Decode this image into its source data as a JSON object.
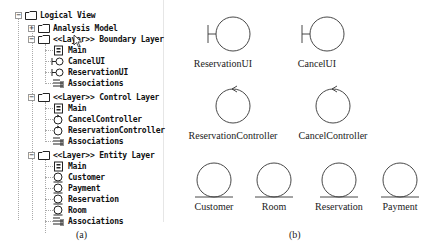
{
  "tree": {
    "root": {
      "label": "Logical View",
      "expander": "−"
    },
    "analysis": {
      "label": "Analysis Model",
      "expander": "+"
    },
    "boundary": {
      "label": "<<Layer>> Boundary Layer",
      "expander": "−",
      "items": [
        {
          "label": "Main",
          "icon": "class-diagram-icon"
        },
        {
          "label": "CancelUI",
          "icon": "boundary-icon"
        },
        {
          "label": "ReservationUI",
          "icon": "boundary-icon"
        },
        {
          "label": "Associations",
          "icon": "associations-icon"
        }
      ]
    },
    "control": {
      "label": "<<Layer>> Control Layer",
      "expander": "−",
      "items": [
        {
          "label": "Main",
          "icon": "class-diagram-icon"
        },
        {
          "label": "CancelController",
          "icon": "control-icon"
        },
        {
          "label": "ReservationController",
          "icon": "control-icon"
        },
        {
          "label": "Associations",
          "icon": "associations-icon"
        }
      ]
    },
    "entity": {
      "label": "<<Layer>> Entity Layer",
      "expander": "−",
      "items": [
        {
          "label": "Main",
          "icon": "class-diagram-icon"
        },
        {
          "label": "Customer",
          "icon": "entity-icon"
        },
        {
          "label": "Payment",
          "icon": "entity-icon"
        },
        {
          "label": "Reservation",
          "icon": "entity-icon"
        },
        {
          "label": "Room",
          "icon": "entity-icon"
        },
        {
          "label": "Associations",
          "icon": "associations-icon"
        }
      ]
    }
  },
  "diagram": {
    "boundary": [
      "ReservationUI",
      "CancelUI"
    ],
    "control": [
      "ReservationController",
      "CancelController"
    ],
    "entity": [
      "Customer",
      "Room",
      "Reservation",
      "Payment"
    ]
  },
  "captions": {
    "a": "(a)",
    "b": "(b)"
  }
}
